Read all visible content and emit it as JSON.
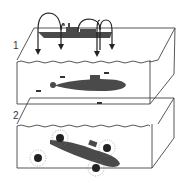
{
  "diagram": {
    "type": "illustration",
    "panels": [
      {
        "label": "1",
        "content": "surface ship dropping depth charges into water; submarine below"
      },
      {
        "label": "2",
        "content": "depth charges exploding around submarine"
      }
    ],
    "colors": {
      "ink": "#3a3a3a",
      "fill": "#555555",
      "background": "#ffffff"
    }
  }
}
